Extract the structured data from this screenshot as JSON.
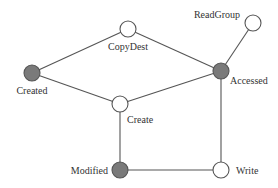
{
  "diagram": {
    "type": "graph",
    "colors": {
      "edge": "#555555",
      "filled_node": "#7a7a7a",
      "empty_node": "#ffffff",
      "label": "#333333"
    },
    "nodes": [
      {
        "id": "CopyDest",
        "label": "CopyDest",
        "x": 128,
        "y": 29,
        "filled": false,
        "label_x": 128,
        "label_y": 50,
        "anchor": "middle"
      },
      {
        "id": "ReadGroup",
        "label": "ReadGroup",
        "x": 253,
        "y": 23,
        "filled": false,
        "label_x": 240,
        "label_y": 18,
        "anchor": "end"
      },
      {
        "id": "Accessed",
        "label": "Accessed",
        "x": 221,
        "y": 71,
        "filled": true,
        "label_x": 230,
        "label_y": 84,
        "anchor": "start"
      },
      {
        "id": "Created",
        "label": "Created",
        "x": 32,
        "y": 73,
        "filled": true,
        "label_x": 32,
        "label_y": 94,
        "anchor": "middle"
      },
      {
        "id": "Create",
        "label": "Create",
        "x": 120,
        "y": 104,
        "filled": false,
        "label_x": 127,
        "label_y": 123,
        "anchor": "start"
      },
      {
        "id": "Modified",
        "label": "Modified",
        "x": 120,
        "y": 170,
        "filled": true,
        "label_x": 108,
        "label_y": 174,
        "anchor": "end"
      },
      {
        "id": "Write",
        "label": "Write",
        "x": 221,
        "y": 170,
        "filled": false,
        "label_x": 236,
        "label_y": 174,
        "anchor": "start"
      }
    ],
    "edges": [
      {
        "from": "Created",
        "to": "CopyDest"
      },
      {
        "from": "CopyDest",
        "to": "Accessed"
      },
      {
        "from": "Created",
        "to": "Create"
      },
      {
        "from": "Create",
        "to": "Accessed"
      },
      {
        "from": "ReadGroup",
        "to": "Accessed"
      },
      {
        "from": "Create",
        "to": "Modified"
      },
      {
        "from": "Accessed",
        "to": "Write"
      },
      {
        "from": "Modified",
        "to": "Write"
      }
    ],
    "node_radius": 8
  }
}
